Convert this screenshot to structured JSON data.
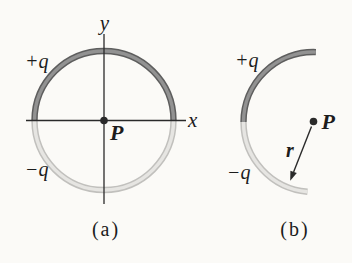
{
  "panel_a": {
    "caption": "(a)",
    "y_axis_label": "y",
    "x_axis_label": "x",
    "positive_label": "+q",
    "negative_label": "−q",
    "point_label": "P"
  },
  "panel_b": {
    "caption": "(b)",
    "positive_label": "+q",
    "negative_label": "−q",
    "point_label": "P",
    "radius_label": "r"
  },
  "colors": {
    "background": "#fbfaf7",
    "line": "#2a2a2a",
    "text": "#1c1c1c",
    "positive_arc_core": "#929292",
    "positive_arc_edge": "#5e5e5e",
    "negative_arc_core": "#e6e5e2",
    "negative_arc_edge": "#c1c0bd"
  }
}
